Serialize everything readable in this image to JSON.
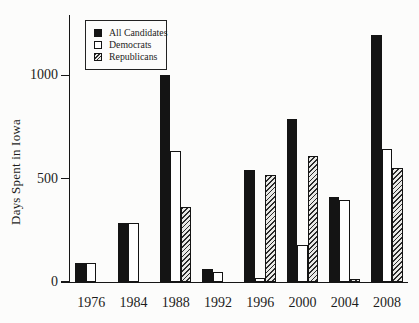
{
  "chart_data": {
    "type": "bar",
    "title": "",
    "xlabel": "",
    "ylabel": "Days Spent in Iowa",
    "categories": [
      "1976",
      "1984",
      "1988",
      "1992",
      "1996",
      "2000",
      "2004",
      "2008"
    ],
    "series": [
      {
        "name": "All Candidates",
        "style": "solid-black",
        "color": "#141414",
        "values": [
          90,
          285,
          1000,
          65,
          540,
          790,
          410,
          1195
        ]
      },
      {
        "name": "Democrats",
        "style": "white-outline",
        "color": "#ffffff",
        "values": [
          90,
          285,
          635,
          50,
          20,
          180,
          395,
          645
        ]
      },
      {
        "name": "Republicans",
        "style": "diagonal-hatch",
        "color": "#555555",
        "values": [
          0,
          0,
          365,
          0,
          520,
          610,
          15,
          550
        ]
      }
    ],
    "yticks": [
      0,
      500,
      1000
    ],
    "ylim": [
      0,
      1292
    ],
    "grid": false,
    "legend_position": "top-left-inside",
    "axis_color": "#161616"
  }
}
